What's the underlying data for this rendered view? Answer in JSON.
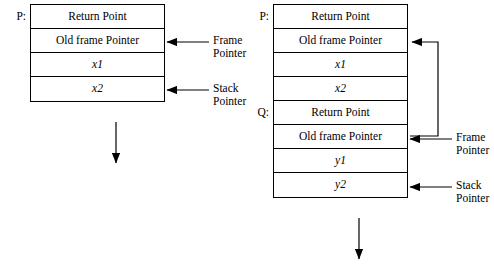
{
  "diagram": {
    "left_stack": {
      "proc_label": "P:",
      "cells": [
        {
          "text": "Return Point",
          "italic": false
        },
        {
          "text": "Old frame Pointer",
          "italic": false
        },
        {
          "text": "x1",
          "italic": true
        },
        {
          "text": "x2",
          "italic": true
        }
      ],
      "annotations": [
        {
          "line1": "Frame",
          "line2": "Pointer"
        },
        {
          "line1": "Stack",
          "line2": "Pointer"
        }
      ]
    },
    "right_stack": {
      "proc_label_1": "P:",
      "proc_label_2": "Q:",
      "cells": [
        {
          "text": "Return Point",
          "italic": false
        },
        {
          "text": "Old frame Pointer",
          "italic": false
        },
        {
          "text": "x1",
          "italic": true
        },
        {
          "text": "x2",
          "italic": true
        },
        {
          "text": "Return Point",
          "italic": false
        },
        {
          "text": "Old frame Pointer",
          "italic": false
        },
        {
          "text": "y1",
          "italic": true
        },
        {
          "text": "y2",
          "italic": true
        }
      ],
      "annotations": [
        {
          "line1": "Frame",
          "line2": "Pointer"
        },
        {
          "line1": "Stack",
          "line2": "Pointer"
        }
      ]
    },
    "caption": ""
  },
  "colors": {
    "line": "#000000",
    "background": "#ffffff"
  }
}
